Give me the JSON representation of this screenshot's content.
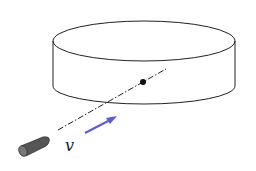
{
  "diagram": {
    "type": "physics-illustration",
    "labels": {
      "velocity": "v"
    },
    "colors": {
      "outline": "#222222",
      "arrow": "#5b5bd6",
      "bullet": "#555555",
      "background": "#ffffff"
    },
    "elements": [
      {
        "name": "cylinder-disk",
        "kind": "cylinder"
      },
      {
        "name": "center-point",
        "kind": "dot"
      },
      {
        "name": "trajectory-line",
        "kind": "dash-dot line"
      },
      {
        "name": "velocity-arrow",
        "kind": "arrow"
      },
      {
        "name": "bullet",
        "kind": "projectile"
      }
    ]
  }
}
